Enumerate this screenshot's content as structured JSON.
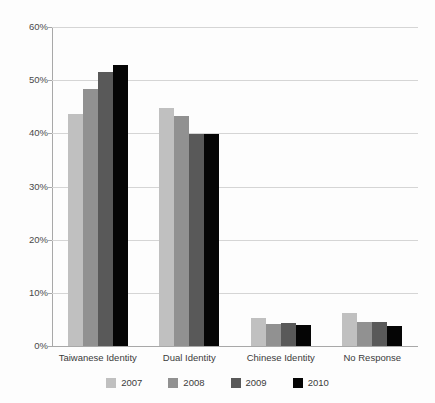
{
  "chart_data": {
    "type": "bar",
    "title": "",
    "subtitle": "",
    "xlabel": "",
    "ylabel": "",
    "ylim": [
      0,
      60
    ],
    "ytick_labels": [
      "60%",
      "50%",
      "40%",
      "30%",
      "20%",
      "10%",
      "0%"
    ],
    "ytick_values": [
      60,
      50,
      40,
      30,
      20,
      10,
      0
    ],
    "grid": true,
    "legend_position": "bottom",
    "value_suffix": "%",
    "categories": [
      "Taiwanese Identity",
      "Dual Identity",
      "Chinese Identity",
      "No Response"
    ],
    "series": [
      {
        "name": "2007",
        "color": "#c0c0c0",
        "values": [
          43.7,
          44.8,
          5.3,
          6.3
        ]
      },
      {
        "name": "2008",
        "color": "#919191",
        "values": [
          48.4,
          43.2,
          4.1,
          4.5
        ]
      },
      {
        "name": "2009",
        "color": "#595959",
        "values": [
          51.6,
          39.9,
          4.3,
          4.5
        ]
      },
      {
        "name": "2010",
        "color": "#050505",
        "values": [
          52.8,
          39.8,
          3.9,
          3.8
        ]
      }
    ]
  },
  "legend": {
    "items": [
      {
        "label": "2007"
      },
      {
        "label": "2008"
      },
      {
        "label": "2009"
      },
      {
        "label": "2010"
      }
    ]
  }
}
